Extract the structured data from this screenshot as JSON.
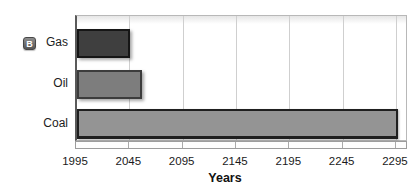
{
  "panel": {
    "label": "B"
  },
  "chart_data": {
    "type": "bar",
    "orientation": "horizontal",
    "title": "",
    "xlabel": "Years",
    "ylabel": "",
    "categories": [
      "Gas",
      "Oil",
      "Coal"
    ],
    "values": [
      2045,
      2056,
      2296
    ],
    "value_meaning": "year at which each fuel reserve runs out; bars start at 1995",
    "x_start": 1995,
    "xlim": [
      1995,
      2306
    ],
    "xticks": [
      1995,
      2045,
      2095,
      2145,
      2195,
      2245,
      2295
    ],
    "grid": "vertical-gridlines-on",
    "legend": "none",
    "bars": [
      {
        "label": "Gas",
        "end_year": 2045,
        "fill": "#3f3f3f",
        "border": "#161616"
      },
      {
        "label": "Oil",
        "end_year": 2056,
        "fill": "#7d7d7d",
        "border": "#3c3c3c"
      },
      {
        "label": "Coal",
        "end_year": 2296,
        "fill": "#949494",
        "border": "#1f1f1f"
      }
    ]
  }
}
